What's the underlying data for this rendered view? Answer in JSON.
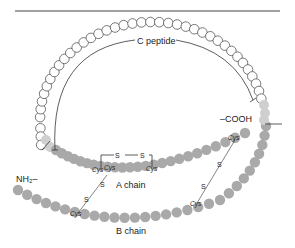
{
  "labels": {
    "c_peptide": "C peptide",
    "a_chain": "A chain",
    "b_chain": "B chain",
    "n_terminus": "NH₂–",
    "c_terminus": "–COOH",
    "cys": "Cys",
    "sulfur": "S"
  },
  "segments": [
    {
      "name": "C peptide",
      "style": "open-circles"
    },
    {
      "name": "A chain",
      "style": "gray-filled"
    },
    {
      "name": "B chain",
      "style": "gray-filled"
    }
  ],
  "disulfide_bonds": [
    {
      "type": "intrachain",
      "chain": "A chain",
      "from": "Cys",
      "to": "Cys"
    },
    {
      "type": "interchain",
      "from": "A chain Cys",
      "to": "B chain Cys"
    },
    {
      "type": "interchain",
      "from": "A chain Cys",
      "to": "B chain Cys"
    }
  ],
  "colors": {
    "c_peptide_stroke": "#555555",
    "chain_fill": "#a9a9a9",
    "cleavage_fill": "#cfcfcf",
    "line": "#333333"
  }
}
